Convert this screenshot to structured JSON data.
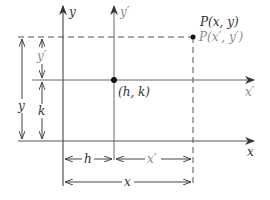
{
  "diagram": {
    "axes": {
      "x_label": "x",
      "y_label": "y",
      "x_prime_label": "x′",
      "y_prime_label": "y′"
    },
    "points": {
      "origin_prime_label": "(h, k)",
      "p_label": "P(x, y)",
      "p_prime_label": "P(x′, y′)"
    },
    "dimensions": {
      "h": "h",
      "k": "k",
      "x": "x",
      "y": "y",
      "x_prime": "x′",
      "y_prime": "y′"
    },
    "colors": {
      "line": "#555555",
      "label": "#333333",
      "label_light": "#8a8a8a",
      "point": "#111111"
    }
  }
}
